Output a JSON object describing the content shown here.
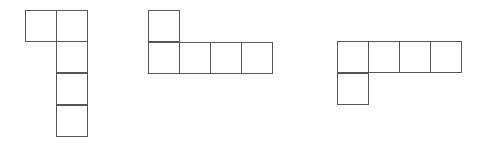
{
  "diagram": {
    "title": "",
    "cell_size": 31,
    "stroke_color": "#555555",
    "background": "#ffffff",
    "shapes": [
      {
        "name": "shape-left-vertical-L",
        "cells": [
          {
            "x": 25,
            "y": 10
          },
          {
            "x": 56,
            "y": 10
          },
          {
            "x": 56,
            "y": 41
          },
          {
            "x": 56,
            "y": 73
          },
          {
            "x": 56,
            "y": 105
          }
        ]
      },
      {
        "name": "shape-middle-horizontal-L-up",
        "cells": [
          {
            "x": 148,
            "y": 10
          },
          {
            "x": 148,
            "y": 42
          },
          {
            "x": 179,
            "y": 42
          },
          {
            "x": 210,
            "y": 42
          },
          {
            "x": 241,
            "y": 42
          }
        ]
      },
      {
        "name": "shape-right-horizontal-L-down",
        "cells": [
          {
            "x": 337,
            "y": 41
          },
          {
            "x": 368,
            "y": 41
          },
          {
            "x": 399,
            "y": 41
          },
          {
            "x": 430,
            "y": 41
          },
          {
            "x": 337,
            "y": 73
          }
        ]
      }
    ]
  }
}
